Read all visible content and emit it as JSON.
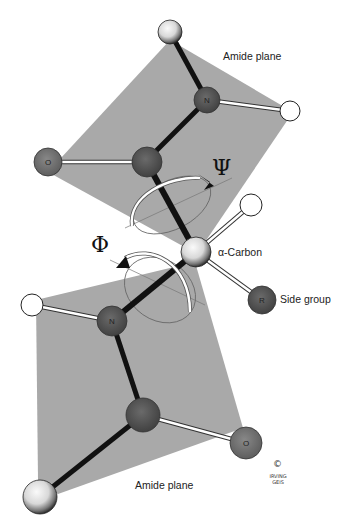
{
  "labels": {
    "amide_plane_top": "Amide plane",
    "amide_plane_bottom": "Amide plane",
    "alpha_carbon": "α-Carbon",
    "side_group": "Side group",
    "psi": "Ψ",
    "phi": "Φ",
    "copyright": "©",
    "signature": "IRVING GEIS"
  },
  "atoms": {
    "n_top": "N",
    "o_top": "O",
    "r_side": "R",
    "n_bottom": "N",
    "o_bottom": "O"
  },
  "colors": {
    "plane": "#a9a9a9",
    "nitrogen": "#555555",
    "carbon": "#686868",
    "oxygen": "#7a7a7a",
    "r_group": "#5c5c5c",
    "hydrogen": "#ffffff",
    "bond": "#111111"
  }
}
